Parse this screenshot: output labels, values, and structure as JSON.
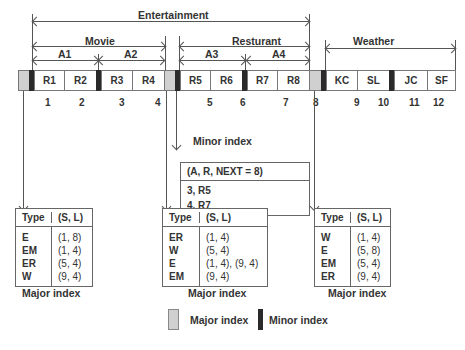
{
  "diagram": {
    "top_labels": {
      "entertainment": "Entertainment",
      "movie": "Movie",
      "a1": "A1",
      "a2": "A2",
      "restaurant": "Resturant",
      "a3": "A3",
      "a4": "A4",
      "weather": "Weather"
    },
    "cells": [
      "R1",
      "R2",
      "R3",
      "R4",
      "R5",
      "R6",
      "R7",
      "R8",
      "KC",
      "SL",
      "JC",
      "SF"
    ],
    "numbers": [
      "1",
      "2",
      "3",
      "4",
      "5",
      "6",
      "7",
      "8",
      "9",
      "10",
      "11",
      "12"
    ],
    "minor_index": {
      "title": "Minor index",
      "header": "(A, R, NEXT = 8)",
      "rows": [
        "3, R5",
        "4, R7"
      ]
    },
    "major_tables": [
      {
        "header": [
          "Type",
          "(S, L)"
        ],
        "rows": [
          [
            "E",
            "(1, 8)"
          ],
          [
            "EM",
            "(1, 4)"
          ],
          [
            "ER",
            "(5, 4)"
          ],
          [
            "W",
            "(9, 4)"
          ]
        ],
        "caption": "Major index"
      },
      {
        "header": [
          "Type",
          "(S, L)"
        ],
        "rows": [
          [
            "ER",
            "(1, 4)"
          ],
          [
            "W",
            "(5, 4)"
          ],
          [
            "E",
            "(1, 4), (9, 4)"
          ],
          [
            "EM",
            "(9, 4)"
          ]
        ],
        "caption": "Major index"
      },
      {
        "header": [
          "Type",
          "(S, L)"
        ],
        "rows": [
          [
            "W",
            "(1, 4)"
          ],
          [
            "E",
            "(5, 8)"
          ],
          [
            "EM",
            "(5, 4)"
          ],
          [
            "ER",
            "(9, 4)"
          ]
        ],
        "caption": "Major index"
      }
    ],
    "legend": {
      "major": "Major index",
      "minor": "Minor index"
    },
    "colors": {
      "major_fill": "#d0d0d0",
      "minor_fill": "#2a2a2a",
      "line": "#555555"
    }
  }
}
